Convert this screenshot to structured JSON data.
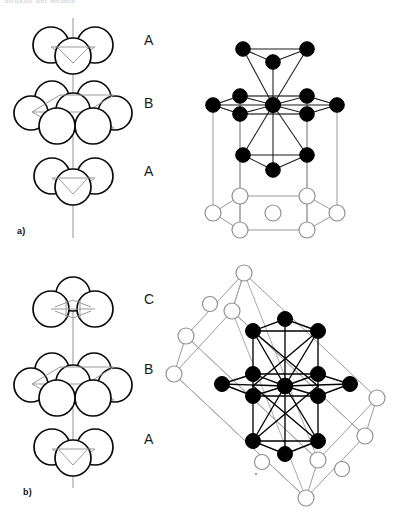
{
  "header": {
    "running_text": "Struktur der Metalle"
  },
  "figure": {
    "panels": [
      {
        "id": "a",
        "label": "a)",
        "structure_name": "hexagonal close packing",
        "stacking_sequence": [
          "A",
          "B",
          "A"
        ],
        "layer_labels": [
          {
            "text": "A",
            "x": 144,
            "y": 38
          },
          {
            "text": "B",
            "x": 144,
            "y": 100
          },
          {
            "text": "A",
            "x": 144,
            "y": 168
          }
        ],
        "unit_cell": "hexagonal prism",
        "coordination": 12,
        "label_pos": {
          "x": 17,
          "y": 226
        }
      },
      {
        "id": "b",
        "label": "b)",
        "structure_name": "cubic close packing",
        "stacking_sequence": [
          "C",
          "B",
          "A"
        ],
        "layer_labels": [
          {
            "text": "C",
            "x": 144,
            "y": 298
          },
          {
            "text": "B",
            "x": 144,
            "y": 368
          },
          {
            "text": "A",
            "x": 144,
            "y": 437
          }
        ],
        "unit_cell": "face centred cubic",
        "coordination": 12,
        "label_pos": {
          "x": 23,
          "y": 487
        }
      }
    ],
    "colors": {
      "filled_atom": "#000000",
      "open_atom": "#ffffff",
      "atom_outline": "#8d8d8d",
      "bond": "#000000",
      "cell_edge": "#9a9a9a",
      "sphere_outline": "#0a0a0a",
      "guide_line": "#9a9a9a",
      "axis": "#9d9d9d",
      "background": "#ffffff"
    }
  }
}
